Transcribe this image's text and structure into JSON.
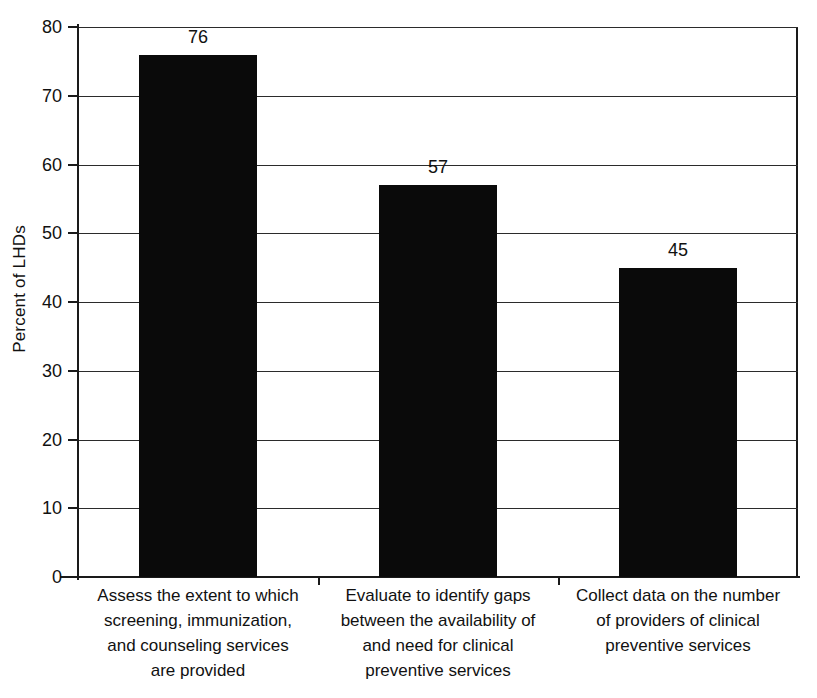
{
  "chart_data": {
    "type": "bar",
    "title": "",
    "subtitle": "",
    "xlabel": "",
    "ylabel": "Percent of LHDs",
    "ylim": [
      0,
      80
    ],
    "ytick_step": 10,
    "yticks": [
      "0",
      "10",
      "20",
      "30",
      "40",
      "50",
      "60",
      "70",
      "80"
    ],
    "grid": true,
    "legend": "none",
    "categories": [
      "Assess the extent to which screening, immunization, and counseling services are provided",
      "Evaluate to identify gaps between the availability of and need for clinical preventive services",
      "Collect data on the number of providers of clinical preventive services"
    ],
    "category_label_lines": [
      [
        "Assess the extent to which",
        "screening, immunization,",
        "and counseling services",
        "are provided"
      ],
      [
        "Evaluate to identify gaps",
        "between the availability of",
        "and need for clinical",
        "preventive services"
      ],
      [
        "Collect data on the number",
        "of providers of clinical",
        "preventive services"
      ]
    ],
    "values": [
      76,
      57,
      45
    ],
    "value_labels": [
      "76",
      "57",
      "45"
    ],
    "bar_color": "#0a0a0a",
    "axis_color": "#1a1a1a",
    "background_color": "#ffffff"
  }
}
